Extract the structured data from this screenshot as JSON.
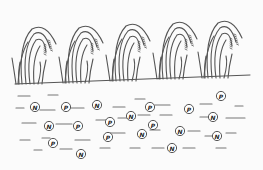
{
  "diagram": {
    "colors": {
      "line": "#555555",
      "background": "#fbfbfb",
      "nutrient_fill": "#ffffff"
    },
    "ground_line": {
      "x1": 15,
      "y1": 84,
      "x2": 250,
      "y2": 75
    },
    "plants": [
      {
        "x": 30,
        "base_y": 84
      },
      {
        "x": 77,
        "base_y": 83
      },
      {
        "x": 124,
        "base_y": 81
      },
      {
        "x": 171,
        "base_y": 79
      },
      {
        "x": 216,
        "base_y": 78
      }
    ],
    "nutrients": [
      {
        "label": "N",
        "x": 35,
        "y": 107
      },
      {
        "label": "P",
        "x": 66,
        "y": 107
      },
      {
        "label": "N",
        "x": 97,
        "y": 105
      },
      {
        "label": "P",
        "x": 150,
        "y": 107
      },
      {
        "label": "P",
        "x": 189,
        "y": 109
      },
      {
        "label": "P",
        "x": 221,
        "y": 96
      },
      {
        "label": "N",
        "x": 49,
        "y": 126
      },
      {
        "label": "P",
        "x": 78,
        "y": 126
      },
      {
        "label": "P",
        "x": 110,
        "y": 122
      },
      {
        "label": "N",
        "x": 131,
        "y": 116
      },
      {
        "label": "P",
        "x": 153,
        "y": 125
      },
      {
        "label": "N",
        "x": 213,
        "y": 117
      },
      {
        "label": "N",
        "x": 142,
        "y": 134
      },
      {
        "label": "N",
        "x": 180,
        "y": 131
      },
      {
        "label": "N",
        "x": 217,
        "y": 136
      },
      {
        "label": "P",
        "x": 108,
        "y": 137
      },
      {
        "label": "P",
        "x": 53,
        "y": 143
      },
      {
        "label": "N",
        "x": 81,
        "y": 154
      },
      {
        "label": "N",
        "x": 172,
        "y": 148
      }
    ],
    "soil_dashes": [
      [
        16,
        108,
        24,
        108
      ],
      [
        40,
        110,
        55,
        110
      ],
      [
        70,
        108,
        84,
        108
      ],
      [
        113,
        107,
        125,
        107
      ],
      [
        135,
        99,
        145,
        99
      ],
      [
        155,
        105,
        170,
        105
      ],
      [
        200,
        104,
        212,
        104
      ],
      [
        235,
        106,
        243,
        106
      ],
      [
        18,
        96,
        30,
        96
      ],
      [
        48,
        95,
        58,
        95
      ],
      [
        22,
        123,
        36,
        123
      ],
      [
        56,
        124,
        72,
        124
      ],
      [
        96,
        120,
        110,
        120
      ],
      [
        118,
        118,
        135,
        118
      ],
      [
        160,
        115,
        172,
        115
      ],
      [
        200,
        117,
        208,
        117
      ],
      [
        226,
        118,
        245,
        118
      ],
      [
        20,
        140,
        30,
        140
      ],
      [
        42,
        138,
        50,
        138
      ],
      [
        75,
        140,
        90,
        140
      ],
      [
        110,
        133,
        125,
        133
      ],
      [
        150,
        130,
        160,
        130
      ],
      [
        188,
        131,
        200,
        131
      ],
      [
        226,
        133,
        236,
        133
      ],
      [
        138,
        115,
        150,
        115
      ],
      [
        34,
        150,
        42,
        150
      ],
      [
        60,
        149,
        72,
        149
      ],
      [
        100,
        148,
        110,
        148
      ],
      [
        130,
        148,
        140,
        148
      ],
      [
        152,
        148,
        164,
        148
      ],
      [
        183,
        148,
        195,
        148
      ],
      [
        216,
        148,
        226,
        148
      ],
      [
        205,
        136,
        212,
        136
      ]
    ]
  }
}
